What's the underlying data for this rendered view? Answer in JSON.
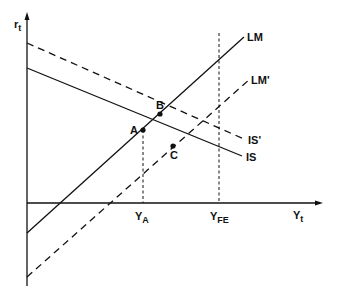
{
  "diagram": {
    "type": "IS-LM diagram",
    "axes": {
      "y_label": "r",
      "y_label_sub": "t",
      "x_label": "Y",
      "x_label_sub": "t"
    },
    "curves": [
      {
        "id": "LM",
        "label": "LM",
        "style": "solid"
      },
      {
        "id": "LM_prime",
        "label": "LM'",
        "style": "dashed"
      },
      {
        "id": "IS",
        "label": "IS",
        "style": "solid"
      },
      {
        "id": "IS_prime",
        "label": "IS'",
        "style": "dashed"
      }
    ],
    "points": [
      {
        "id": "A",
        "label": "A",
        "desc": "intersection of IS and LM"
      },
      {
        "id": "B",
        "label": "B",
        "desc": "intersection of IS' and LM"
      },
      {
        "id": "C",
        "label": "C",
        "desc": "intersection of IS and LM'"
      }
    ],
    "x_markers": [
      {
        "id": "YA",
        "label": "Y",
        "sub": "A",
        "style": "dashed"
      },
      {
        "id": "YFE",
        "label": "Y",
        "sub": "FE",
        "style": "dashed"
      }
    ],
    "colors": {
      "line": "#111111",
      "background": "#ffffff"
    }
  }
}
